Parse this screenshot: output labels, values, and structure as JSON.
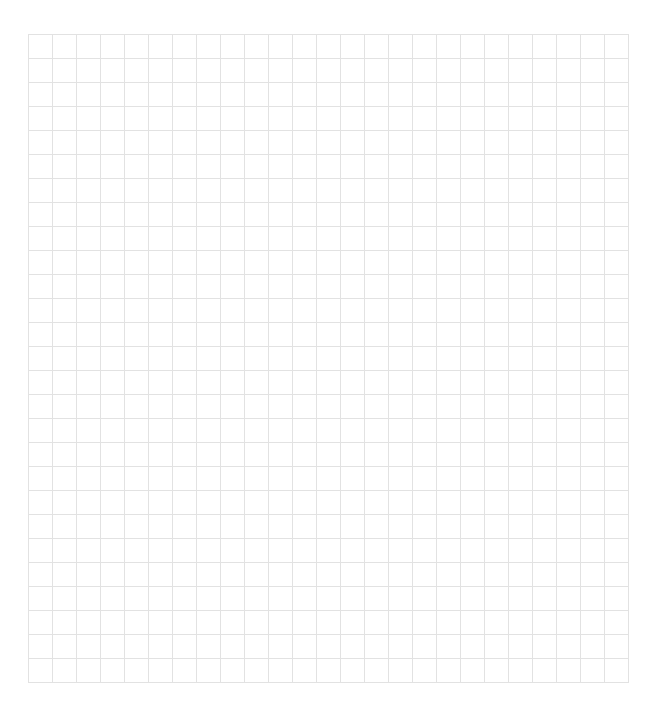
{
  "grid": {
    "columns": 25,
    "rows": 27,
    "cell_width_px": 24,
    "cell_height_px": 24,
    "origin_x_px": 28,
    "origin_y_px": 34,
    "line_color": "#e2e2e2",
    "background_color": "#ffffff"
  }
}
